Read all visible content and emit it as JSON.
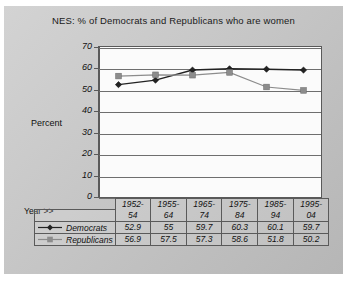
{
  "chart_data": {
    "type": "line",
    "title": "NES:  % of Democrats and Republicans who are women",
    "xlabel": "Year >>",
    "ylabel": "Percent",
    "categories": [
      "1952-54",
      "1955-64",
      "1965-74",
      "1975-84",
      "1985-94",
      "1995-04"
    ],
    "category_lines": [
      {
        "top": "1952-",
        "bottom": "54"
      },
      {
        "top": "1955-",
        "bottom": "64"
      },
      {
        "top": "1965-",
        "bottom": "74"
      },
      {
        "top": "1975-",
        "bottom": "84"
      },
      {
        "top": "1985-",
        "bottom": "94"
      },
      {
        "top": "1995-",
        "bottom": "04"
      }
    ],
    "series": [
      {
        "name": "Democrats",
        "values": [
          52.9,
          55,
          59.7,
          60.3,
          60.1,
          59.7
        ],
        "labels": [
          "52.9",
          "55",
          "59.7",
          "60.3",
          "60.1",
          "59.7"
        ],
        "color": "#222222",
        "marker": "diamond"
      },
      {
        "name": "Republicans",
        "values": [
          56.9,
          57.5,
          57.3,
          58.6,
          51.8,
          50.2
        ],
        "labels": [
          "56.9",
          "57.5",
          "57.3",
          "58.6",
          "51.8",
          "50.2"
        ],
        "color": "#8c8c8c",
        "marker": "square"
      }
    ],
    "ylim": [
      0,
      70
    ],
    "yticks": [
      70,
      60,
      50,
      40,
      30,
      20,
      10,
      0
    ],
    "ytick_labels": [
      "70",
      "60",
      "50",
      "40",
      "30",
      "20",
      "10",
      "0"
    ],
    "grid": "horizontal",
    "legend_position": "table-left"
  }
}
